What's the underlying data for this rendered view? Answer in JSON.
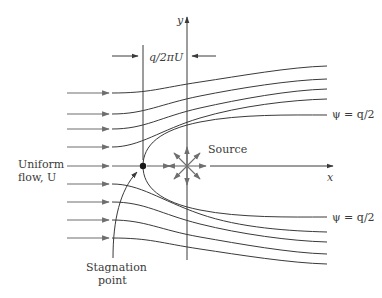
{
  "figure": {
    "type": "flow-diagram",
    "labels": {
      "y_axis": "y",
      "x_axis": "x",
      "dimension": "q/2πU",
      "source": "Source",
      "uniform_flow_line1": "Uniform",
      "uniform_flow_line2": "flow, U",
      "psi_upper": "ψ = q/2",
      "psi_lower": "ψ = q/2",
      "stagnation_line1": "Stagnation",
      "stagnation_line2": "point"
    },
    "colors": {
      "line": "#3a3a3a",
      "arrow_gray": "#6e6e6e",
      "text": "#3a3a3a",
      "background": "#ffffff"
    },
    "geometry": {
      "stagnation_point": [
        143,
        166
      ],
      "source_point": [
        187,
        166
      ],
      "uniform_arrow_rows_y": [
        93,
        114,
        129,
        147,
        166,
        184,
        202,
        220,
        238
      ],
      "upper_streamline_end_y": [
        66,
        79,
        89,
        99,
        115
      ],
      "lower_streamline_end_y": [
        217,
        232,
        242,
        254,
        264
      ]
    }
  }
}
